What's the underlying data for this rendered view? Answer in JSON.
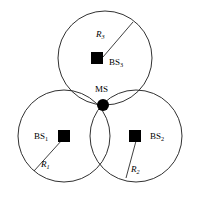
{
  "figure": {
    "type": "cellular-network-diagram",
    "background_color": "#ffffff",
    "stroke_color": "#1a1a1a",
    "marker_color": "#000000"
  },
  "mobile_station": {
    "label": "MS",
    "marker": "filled-circle",
    "x": 103,
    "y": 105,
    "dot_radius": 6
  },
  "cells": [
    {
      "id": "cell-3",
      "bs_label_main": "BS",
      "bs_label_sub": "3",
      "radius_label_main": "R",
      "radius_label_sub": "3",
      "center_x": 105,
      "center_y": 58,
      "radius": 47,
      "bs_x": 97,
      "bs_y": 52,
      "radius_line_end_x": 133,
      "radius_line_end_y": 22
    },
    {
      "id": "cell-1",
      "bs_label_main": "BS",
      "bs_label_sub": "1",
      "radius_label_main": "R",
      "radius_label_sub": "1",
      "center_x": 64,
      "center_y": 136,
      "radius": 46,
      "bs_x": 64,
      "bs_y": 136,
      "radius_line_end_x": 34,
      "radius_line_end_y": 171
    },
    {
      "id": "cell-2",
      "bs_label_main": "BS",
      "bs_label_sub": "2",
      "radius_label_main": "R",
      "radius_label_sub": "2",
      "center_x": 136,
      "center_y": 136,
      "radius": 46,
      "bs_x": 135,
      "bs_y": 136,
      "radius_line_end_x": 126,
      "radius_line_end_y": 178
    }
  ],
  "labels": {
    "r3": {
      "main": "R",
      "sub": "3"
    },
    "bs3": {
      "main": "BS",
      "sub": "3"
    },
    "ms": {
      "main": "MS"
    },
    "bs1": {
      "main": "BS",
      "sub": "1"
    },
    "r1": {
      "main": "R",
      "sub": "1"
    },
    "bs2": {
      "main": "BS",
      "sub": "2"
    },
    "r2": {
      "main": "R",
      "sub": "2"
    }
  }
}
